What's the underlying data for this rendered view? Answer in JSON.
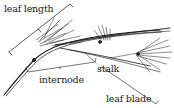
{
  "diagram": {
    "labels": {
      "leaf_length": "leaf length",
      "internode": "internode",
      "stalk": "stalk",
      "leaf_blade": "leaf blade"
    },
    "colors": {
      "ink": "#1a1a1a",
      "background": "#ffffff"
    }
  }
}
